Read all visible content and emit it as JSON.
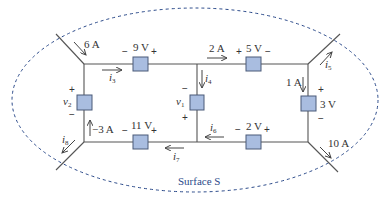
{
  "diagram": {
    "type": "circuit",
    "surface_label": "Surface S",
    "colors": {
      "element_fill": "#a9bde0",
      "element_stroke": "#4a5a78",
      "wire": "#555555",
      "surface": "#2b4a8a"
    },
    "elements": [
      {
        "id": "e-9v",
        "label": "9 V",
        "minus": "−",
        "plus": "+"
      },
      {
        "id": "e-5v",
        "label": "5 V",
        "minus": "−",
        "plus": "+"
      },
      {
        "id": "e-3v",
        "label": "3 V",
        "minus": "−",
        "plus": "+"
      },
      {
        "id": "e-v1",
        "label": "v",
        "sub": "1",
        "minus": "−",
        "plus": "+"
      },
      {
        "id": "e-v2",
        "label": "v",
        "sub": "2",
        "minus": "−",
        "plus": "+"
      },
      {
        "id": "e-11v",
        "label": "11 V",
        "minus": "−",
        "plus": "+"
      },
      {
        "id": "e-2v",
        "label": "2 V",
        "minus": "−",
        "plus": "+"
      }
    ],
    "currents": [
      {
        "id": "c-6a",
        "label": "6 A"
      },
      {
        "id": "c-2a",
        "label": "2 A"
      },
      {
        "id": "c-1a",
        "label": "1 A"
      },
      {
        "id": "c-m3a",
        "label": "−3 A"
      },
      {
        "id": "c-10a",
        "label": "10 A"
      },
      {
        "id": "c-i3",
        "label": "i",
        "sub": "3"
      },
      {
        "id": "c-i4",
        "label": "i",
        "sub": "4"
      },
      {
        "id": "c-i5",
        "label": "i",
        "sub": "5"
      },
      {
        "id": "c-i6",
        "label": "i",
        "sub": "6"
      },
      {
        "id": "c-i7",
        "label": "i",
        "sub": "7"
      },
      {
        "id": "c-i8",
        "label": "i",
        "sub": "8"
      }
    ]
  }
}
